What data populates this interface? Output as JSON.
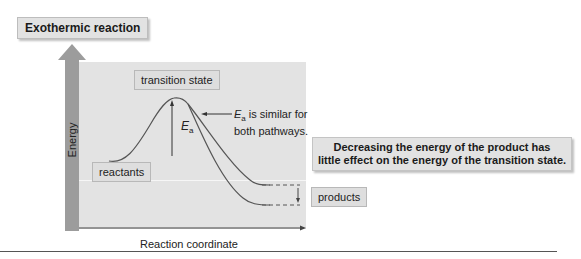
{
  "diagram": {
    "title": "Exothermic reaction",
    "y_axis_label": "Energy",
    "x_axis_label": "Reaction coordinate",
    "labels": {
      "transition_state": "transition state",
      "reactants": "reactants",
      "products": "products"
    },
    "annotations": {
      "ea_symbol": "E",
      "ea_subscript": "a",
      "ea_note_rest_line1": " is similar for",
      "ea_note_line2": "both pathways."
    },
    "note": {
      "line1": "Decreasing the energy of the product has",
      "line2": "little effect on the energy of the transition state."
    },
    "colors": {
      "panel": "#e3e3e3",
      "arrow": "#9c9c9c",
      "curve": "#555555",
      "label_box": "#dedede"
    }
  }
}
